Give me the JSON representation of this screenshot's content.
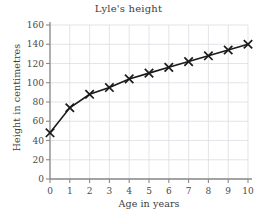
{
  "chart_data": {
    "type": "line",
    "title": "Lyle's height",
    "xlabel": "Age in years",
    "ylabel": "Height in centimetres",
    "x": [
      0,
      1,
      2,
      3,
      4,
      5,
      6,
      7,
      8,
      9,
      10
    ],
    "values": [
      48,
      74,
      88,
      95,
      104,
      110,
      116,
      122,
      128,
      134,
      140
    ],
    "series": [
      {
        "name": "Lyle's height",
        "values": [
          48,
          74,
          88,
          95,
          104,
          110,
          116,
          122,
          128,
          134,
          140
        ]
      }
    ],
    "xlim": [
      0,
      10
    ],
    "ylim": [
      0,
      160
    ],
    "xticks": [
      "0",
      "1",
      "2",
      "3",
      "4",
      "5",
      "6",
      "7",
      "8",
      "9",
      "10"
    ],
    "yticks": [
      "0",
      "20",
      "40",
      "60",
      "80",
      "100",
      "120",
      "140",
      "160"
    ],
    "grid": true,
    "legend": "none",
    "marker": "x",
    "line_color": "#1a1a1a",
    "grid_color": "#d8d8e0",
    "axis_color": "#8a8a8a"
  }
}
